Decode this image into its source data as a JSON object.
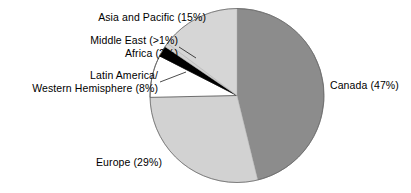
{
  "chart_data": {
    "type": "pie",
    "title": "",
    "subtitle": "",
    "xlabel": "",
    "ylabel": "",
    "legend_position": "none",
    "grid": false,
    "labels_show_percent": true,
    "start_angle_deg": 0,
    "direction": "clockwise",
    "categories": [
      "Canada",
      "Europe",
      "Latin America/Western Hemisphere",
      "Africa",
      "Middle East",
      "Asia and Pacific"
    ],
    "values": [
      47,
      29,
      8,
      2,
      0.8,
      15
    ],
    "percent_strings": [
      "47%",
      "29%",
      "8%",
      "2%",
      ">1%",
      "15%"
    ],
    "colors": [
      "#8c8c8c",
      "#d2d2d2",
      "#ffffff",
      "#000000",
      "#d2d2d2",
      "#d6d6d6"
    ],
    "slices": [
      {
        "name": "Canada",
        "value": 47,
        "percent_label": "47%",
        "color": "#8c8c8c"
      },
      {
        "name": "Europe",
        "value": 29,
        "percent_label": "29%",
        "color": "#d2d2d2"
      },
      {
        "name": "Latin America/Western Hemisphere",
        "value": 8,
        "percent_label": "8%",
        "color": "#ffffff"
      },
      {
        "name": "Africa",
        "value": 2,
        "percent_label": "2%",
        "color": "#000000"
      },
      {
        "name": "Middle East",
        "value": 0.8,
        "percent_label": ">1%",
        "color": "#d2d2d2"
      },
      {
        "name": "Asia and Pacific",
        "value": 15,
        "percent_label": "15%",
        "color": "#d6d6d6"
      }
    ]
  },
  "labels": {
    "asia": "Asia and Pacific (15%)",
    "middle_east": "Middle East (>1%)",
    "africa": "Africa (2%)",
    "latin_line1": "Latin America/",
    "latin_line2": "Western Hemisphere (8%)",
    "canada": "Canada (47%)",
    "europe": "Europe (29%)"
  }
}
